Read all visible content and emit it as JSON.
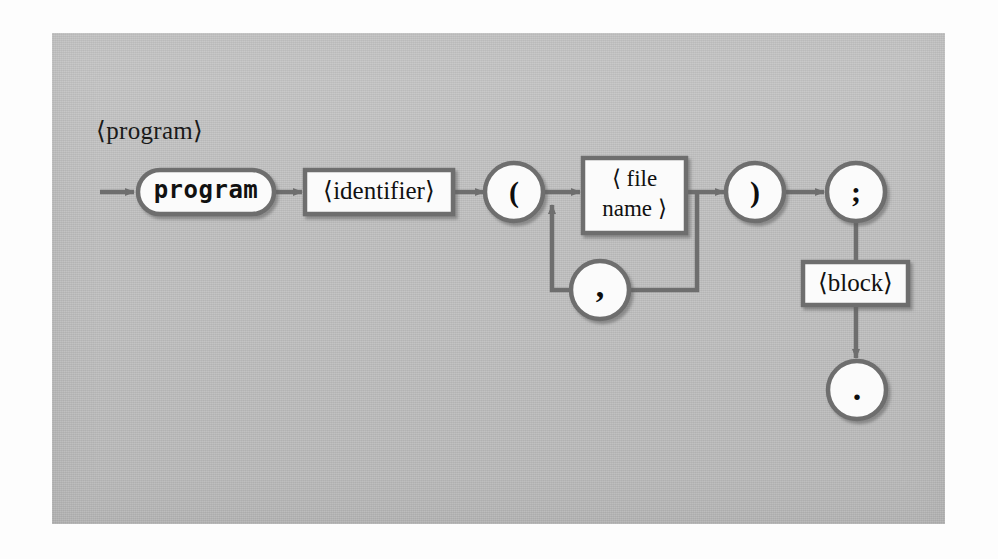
{
  "figure": {
    "kind": "syntax-railroad-diagram",
    "rule_name": "⟨program⟩",
    "plate_color": "#bfbfbf",
    "line_color": "#6e6e6e",
    "node_fill": "#fbfbfb",
    "text_color": "#111111"
  },
  "nodes": {
    "start_arrow": {
      "type": "entry-arrow"
    },
    "terminal_program": {
      "type": "terminal",
      "shape": "stadium",
      "label": "program"
    },
    "nonterminal_identifier": {
      "type": "nonterminal",
      "shape": "rectangle",
      "label": "⟨identifier⟩"
    },
    "paren_open": {
      "type": "terminal",
      "shape": "circle",
      "label": "("
    },
    "nonterminal_file_name": {
      "type": "nonterminal",
      "shape": "rectangle",
      "label_line1": "⟨ file",
      "label_line2": "name ⟩"
    },
    "comma": {
      "type": "terminal",
      "shape": "circle",
      "label": ","
    },
    "paren_close": {
      "type": "terminal",
      "shape": "circle",
      "label": ")"
    },
    "semicolon": {
      "type": "terminal",
      "shape": "circle",
      "label": ";"
    },
    "nonterminal_block": {
      "type": "nonterminal",
      "shape": "rectangle",
      "label": "⟨block⟩"
    },
    "period": {
      "type": "terminal",
      "shape": "circle",
      "label": "."
    }
  },
  "edges": [
    {
      "from": "start_arrow",
      "to": "terminal_program",
      "arrow": true
    },
    {
      "from": "terminal_program",
      "to": "nonterminal_identifier",
      "arrow": true
    },
    {
      "from": "nonterminal_identifier",
      "to": "paren_open",
      "arrow": true
    },
    {
      "from": "paren_open",
      "to": "nonterminal_file_name",
      "arrow": true
    },
    {
      "from": "nonterminal_file_name",
      "to": "paren_close",
      "arrow": true
    },
    {
      "from": "paren_close",
      "to": "semicolon",
      "arrow": true
    },
    {
      "from": "semicolon",
      "to": "nonterminal_block",
      "arrow": false
    },
    {
      "from": "nonterminal_block",
      "to": "period",
      "arrow": true
    },
    {
      "from": "nonterminal_file_name",
      "to": "comma",
      "arrow": false,
      "note": "repeat loop back"
    },
    {
      "from": "comma",
      "to": "nonterminal_file_name",
      "arrow": true,
      "note": "repeat loop return"
    }
  ]
}
